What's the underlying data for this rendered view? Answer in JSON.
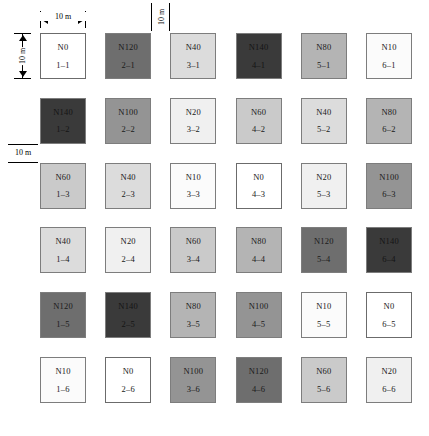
{
  "figure": {
    "type": "grid-plot-layout",
    "grid": {
      "columns": 6,
      "rows": 6
    },
    "annotations": {
      "plot_width": "10 m",
      "plot_height": "10 m",
      "column_gap": "10 m",
      "row_gap": "10 m"
    },
    "shade_scale": {
      "N0": "#ffffff",
      "N10": "#fbfbfb",
      "N20": "#f0f0f0",
      "N40": "#dcdcdc",
      "N60": "#cacaca",
      "N80": "#b4b4b4",
      "N100": "#949494",
      "N120": "#6e6e6e",
      "N140": "#3a3a3a"
    },
    "cells": [
      [
        {
          "treatment": "N0",
          "id": "1–1"
        },
        {
          "treatment": "N120",
          "id": "2–1"
        },
        {
          "treatment": "N40",
          "id": "3–1"
        },
        {
          "treatment": "N140",
          "id": "4–1"
        },
        {
          "treatment": "N80",
          "id": "5–1"
        },
        {
          "treatment": "N10",
          "id": "6–1"
        }
      ],
      [
        {
          "treatment": "N140",
          "id": "1–2"
        },
        {
          "treatment": "N100",
          "id": "2–2"
        },
        {
          "treatment": "N20",
          "id": "3–2"
        },
        {
          "treatment": "N60",
          "id": "4–2"
        },
        {
          "treatment": "N40",
          "id": "5–2"
        },
        {
          "treatment": "N80",
          "id": "6–2"
        }
      ],
      [
        {
          "treatment": "N60",
          "id": "1–3"
        },
        {
          "treatment": "N40",
          "id": "2–3"
        },
        {
          "treatment": "N10",
          "id": "3–3"
        },
        {
          "treatment": "N0",
          "id": "4–3"
        },
        {
          "treatment": "N20",
          "id": "5–3"
        },
        {
          "treatment": "N100",
          "id": "6–3"
        }
      ],
      [
        {
          "treatment": "N40",
          "id": "1–4"
        },
        {
          "treatment": "N20",
          "id": "2–4"
        },
        {
          "treatment": "N60",
          "id": "3–4"
        },
        {
          "treatment": "N80",
          "id": "4–4"
        },
        {
          "treatment": "N120",
          "id": "5–4"
        },
        {
          "treatment": "N140",
          "id": "6–4"
        }
      ],
      [
        {
          "treatment": "N120",
          "id": "1–5"
        },
        {
          "treatment": "N140",
          "id": "2–5"
        },
        {
          "treatment": "N80",
          "id": "3–5"
        },
        {
          "treatment": "N100",
          "id": "4–5"
        },
        {
          "treatment": "N10",
          "id": "5–5"
        },
        {
          "treatment": "N0",
          "id": "6–5"
        }
      ],
      [
        {
          "treatment": "N10",
          "id": "1–6"
        },
        {
          "treatment": "N0",
          "id": "2–6"
        },
        {
          "treatment": "N100",
          "id": "3–6"
        },
        {
          "treatment": "N120",
          "id": "4–6"
        },
        {
          "treatment": "N60",
          "id": "5–6"
        },
        {
          "treatment": "N20",
          "id": "6–6"
        }
      ]
    ]
  },
  "chart_data": {
    "type": "heatmap",
    "title": "",
    "xlabel": "",
    "ylabel": "",
    "categories": [
      "1",
      "2",
      "3",
      "4",
      "5",
      "6"
    ],
    "rows": [
      "1",
      "2",
      "3",
      "4",
      "5",
      "6"
    ],
    "series": [
      {
        "name": "row 1",
        "values": [
          0,
          120,
          40,
          140,
          80,
          10
        ]
      },
      {
        "name": "row 2",
        "values": [
          140,
          100,
          20,
          60,
          40,
          80
        ]
      },
      {
        "name": "row 3",
        "values": [
          60,
          40,
          10,
          0,
          20,
          100
        ]
      },
      {
        "name": "row 4",
        "values": [
          40,
          20,
          60,
          80,
          120,
          140
        ]
      },
      {
        "name": "row 5",
        "values": [
          120,
          140,
          80,
          100,
          10,
          0
        ]
      },
      {
        "name": "row 6",
        "values": [
          10,
          0,
          100,
          120,
          60,
          20
        ]
      }
    ],
    "value_levels": [
      0,
      10,
      20,
      40,
      60,
      80,
      100,
      120,
      140
    ],
    "grid": false,
    "legend": "none"
  }
}
